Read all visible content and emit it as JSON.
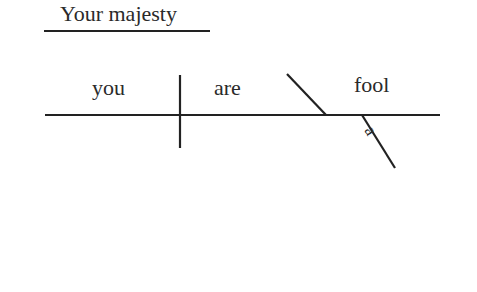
{
  "diagram": {
    "type": "sentence-diagram",
    "address": "Your majesty",
    "subject": "you",
    "verb": "are",
    "predicate_nominative": "fool",
    "modifier": "a",
    "line_color": "#222222"
  }
}
